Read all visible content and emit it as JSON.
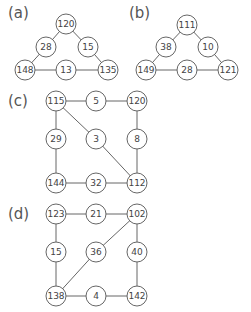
{
  "diagrams": [
    {
      "label": "(a)",
      "label_pos": [
        8,
        18
      ],
      "nodes": [
        {
          "id": "n0",
          "value": "120",
          "x": 66,
          "y": 24
        },
        {
          "id": "n1",
          "value": "28",
          "x": 46,
          "y": 47
        },
        {
          "id": "n2",
          "value": "15",
          "x": 88,
          "y": 47
        },
        {
          "id": "n3",
          "value": "148",
          "x": 25,
          "y": 70
        },
        {
          "id": "n4",
          "value": "13",
          "x": 66,
          "y": 70
        },
        {
          "id": "n5",
          "value": "135",
          "x": 108,
          "y": 70
        }
      ],
      "edges": [
        [
          "n0",
          "n1"
        ],
        [
          "n1",
          "n3"
        ],
        [
          "n0",
          "n2"
        ],
        [
          "n2",
          "n5"
        ],
        [
          "n3",
          "n4"
        ],
        [
          "n4",
          "n5"
        ]
      ]
    },
    {
      "label": "(b)",
      "label_pos": [
        129,
        18
      ],
      "nodes": [
        {
          "id": "n0",
          "value": "111",
          "x": 187,
          "y": 25
        },
        {
          "id": "n1",
          "value": "38",
          "x": 166,
          "y": 47
        },
        {
          "id": "n2",
          "value": "10",
          "x": 208,
          "y": 47
        },
        {
          "id": "n3",
          "value": "149",
          "x": 146,
          "y": 70
        },
        {
          "id": "n4",
          "value": "28",
          "x": 187,
          "y": 70
        },
        {
          "id": "n5",
          "value": "121",
          "x": 228,
          "y": 70
        }
      ],
      "edges": [
        [
          "n0",
          "n1"
        ],
        [
          "n1",
          "n3"
        ],
        [
          "n0",
          "n2"
        ],
        [
          "n2",
          "n5"
        ],
        [
          "n3",
          "n4"
        ],
        [
          "n4",
          "n5"
        ]
      ]
    },
    {
      "label": "(c)",
      "label_pos": [
        8,
        106
      ],
      "nodes": [
        {
          "id": "n0",
          "value": "115",
          "x": 56,
          "y": 101
        },
        {
          "id": "n1",
          "value": "5",
          "x": 96,
          "y": 101
        },
        {
          "id": "n2",
          "value": "120",
          "x": 137,
          "y": 101
        },
        {
          "id": "n3",
          "value": "29",
          "x": 56,
          "y": 139
        },
        {
          "id": "n4",
          "value": "3",
          "x": 96,
          "y": 139
        },
        {
          "id": "n5",
          "value": "8",
          "x": 137,
          "y": 139
        },
        {
          "id": "n6",
          "value": "144",
          "x": 56,
          "y": 183
        },
        {
          "id": "n7",
          "value": "32",
          "x": 96,
          "y": 183
        },
        {
          "id": "n8",
          "value": "112",
          "x": 137,
          "y": 183
        }
      ],
      "edges": [
        [
          "n0",
          "n1"
        ],
        [
          "n1",
          "n2"
        ],
        [
          "n0",
          "n3"
        ],
        [
          "n3",
          "n6"
        ],
        [
          "n2",
          "n5"
        ],
        [
          "n5",
          "n8"
        ],
        [
          "n6",
          "n7"
        ],
        [
          "n7",
          "n8"
        ],
        [
          "n0",
          "n4"
        ],
        [
          "n4",
          "n8"
        ]
      ]
    },
    {
      "label": "(d)",
      "label_pos": [
        8,
        219
      ],
      "nodes": [
        {
          "id": "n0",
          "value": "123",
          "x": 56,
          "y": 214
        },
        {
          "id": "n1",
          "value": "21",
          "x": 96,
          "y": 214
        },
        {
          "id": "n2",
          "value": "102",
          "x": 137,
          "y": 214
        },
        {
          "id": "n3",
          "value": "15",
          "x": 56,
          "y": 252
        },
        {
          "id": "n4",
          "value": "36",
          "x": 96,
          "y": 252
        },
        {
          "id": "n5",
          "value": "40",
          "x": 137,
          "y": 252
        },
        {
          "id": "n6",
          "value": "138",
          "x": 56,
          "y": 296
        },
        {
          "id": "n7",
          "value": "4",
          "x": 96,
          "y": 296
        },
        {
          "id": "n8",
          "value": "142",
          "x": 137,
          "y": 296
        }
      ],
      "edges": [
        [
          "n0",
          "n1"
        ],
        [
          "n1",
          "n2"
        ],
        [
          "n0",
          "n3"
        ],
        [
          "n3",
          "n6"
        ],
        [
          "n2",
          "n5"
        ],
        [
          "n5",
          "n8"
        ],
        [
          "n6",
          "n7"
        ],
        [
          "n7",
          "n8"
        ],
        [
          "n2",
          "n4"
        ],
        [
          "n4",
          "n6"
        ]
      ]
    }
  ],
  "style": {
    "node_radius": 10,
    "stroke_color": "#666666",
    "text_color": "#444444",
    "background": "#ffffff"
  }
}
